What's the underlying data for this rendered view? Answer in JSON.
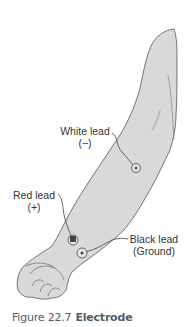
{
  "figure": {
    "caption": {
      "number": "Figure 22.7",
      "title": "Electrode"
    },
    "labels": {
      "white_lead": {
        "name": "White lead",
        "polarity": "(−)"
      },
      "red_lead": {
        "name": "Red lead",
        "polarity": "(+)"
      },
      "black_lead": {
        "name": "Black lead",
        "polarity": "(Ground)"
      }
    },
    "colors": {
      "skin_fill": "#d9d9d9",
      "outline": "#555555",
      "caption_text": "#4d5d68"
    }
  }
}
